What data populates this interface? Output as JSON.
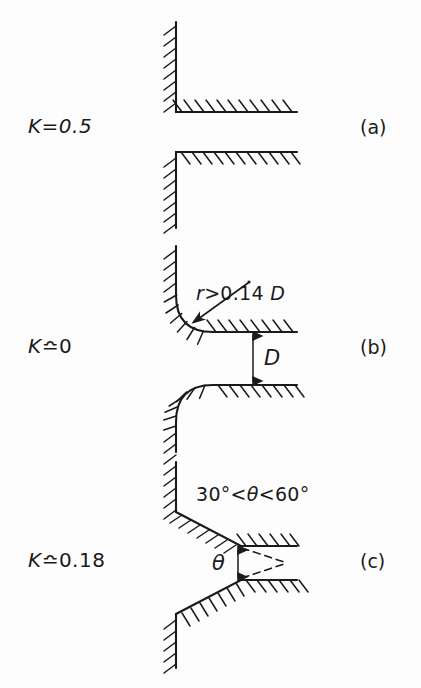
{
  "figure": {
    "type": "engineering-diagram",
    "background_color": "#fdfdfd",
    "line_color": "#1a1a1a"
  },
  "cases": [
    {
      "id": "a",
      "k_symbol": "K",
      "k_relation": "=",
      "k_value": "0.5",
      "k_label": "K=0.5",
      "part_label": "(a)",
      "geometry": "square-edged / sharp re-entrant inlet",
      "annotations": []
    },
    {
      "id": "b",
      "k_symbol": "K",
      "k_relation": "≏",
      "k_value": "0",
      "k_label": "K≏0",
      "part_label": "(b)",
      "geometry": "rounded (bellmouth) inlet",
      "annotations": [
        {
          "name": "radius-note",
          "text": "r>0.14 D",
          "symbol": "r",
          "operator": ">",
          "value": "0.14",
          "reference": "D"
        },
        {
          "name": "diameter-dimension",
          "text": "D"
        }
      ]
    },
    {
      "id": "c",
      "k_symbol": "K",
      "k_relation": "≏",
      "k_value": "0.18",
      "k_label": "K≏0.18",
      "part_label": "(c)",
      "geometry": "chamfered / bevelled inlet",
      "annotations": [
        {
          "name": "angle-range-note",
          "text": "30°<θ<60°",
          "min": "30°",
          "max": "60°",
          "symbol": "θ"
        },
        {
          "name": "angle-dimension",
          "text": "θ"
        }
      ]
    }
  ],
  "labels": {
    "k_a": "K=0.5",
    "k_b_symbol": "K",
    "k_b_rel": "≏",
    "k_b_value": "0",
    "k_c_symbol": "K",
    "k_c_rel": "≏",
    "k_c_value": "0.18",
    "part_a": "(a)",
    "part_b": "(b)",
    "part_c": "(c)",
    "radius_note_r": "r",
    "radius_note_rest": ">0.14 ",
    "radius_note_D": "D",
    "dim_D": "D",
    "angle_note_pre": "30°<",
    "angle_note_theta": "θ",
    "angle_note_post": "<60°",
    "dim_theta": "θ"
  }
}
